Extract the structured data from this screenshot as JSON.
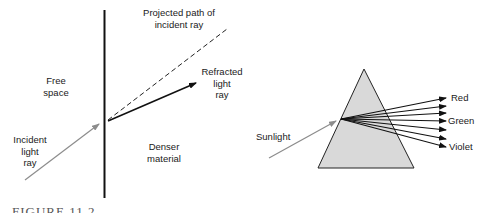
{
  "refraction_panel": {
    "labels": {
      "projected_path": "Projected path of\nincident ray",
      "refracted_ray": "Refracted\nlight\nray",
      "free_space": "Free\nspace",
      "incident_ray": "Incident\nlight\nray",
      "denser_material": "Denser\nmaterial"
    }
  },
  "prism_panel": {
    "labels": {
      "sunlight": "Sunlight",
      "red": "Red",
      "green": "Green",
      "violet": "Violet"
    },
    "colors": {
      "prism_fill": "#d9d9d9",
      "incident_ray": "#8c8c8c"
    }
  },
  "caption": "FIGURE 11.2"
}
